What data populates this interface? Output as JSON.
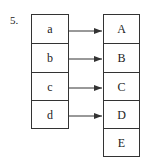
{
  "problem_number": "5.",
  "domain_set": [
    "a",
    "b",
    "c",
    "d"
  ],
  "codomain_set": [
    "A",
    "B",
    "C",
    "D",
    "E"
  ],
  "mapping": [
    {
      "from": "a",
      "to": "A"
    },
    {
      "from": "b",
      "to": "B"
    },
    {
      "from": "c",
      "to": "C"
    },
    {
      "from": "d",
      "to": "D"
    }
  ],
  "colors": {
    "line": "#333333",
    "background": "#ffffff"
  }
}
